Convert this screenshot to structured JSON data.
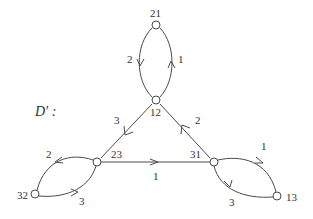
{
  "title": "D′ :",
  "nodes": [
    {
      "id": "21",
      "label": "21",
      "x": 156,
      "y": 25
    },
    {
      "id": "12",
      "label": "12",
      "x": 156,
      "y": 100
    },
    {
      "id": "23",
      "label": "23",
      "x": 97,
      "y": 162
    },
    {
      "id": "31",
      "label": "31",
      "x": 214,
      "y": 162
    },
    {
      "id": "32",
      "label": "32",
      "x": 35,
      "y": 194
    },
    {
      "id": "13",
      "label": "13",
      "x": 277,
      "y": 196
    }
  ],
  "edges": [
    {
      "from": "21",
      "to": "12",
      "label": "2"
    },
    {
      "from": "12",
      "to": "21",
      "label": "1"
    },
    {
      "from": "12",
      "to": "23",
      "label": "3"
    },
    {
      "from": "31",
      "to": "12",
      "label": "2"
    },
    {
      "from": "23",
      "to": "31",
      "label": "1"
    },
    {
      "from": "23",
      "to": "32",
      "label": "2"
    },
    {
      "from": "32",
      "to": "23",
      "label": "3"
    },
    {
      "from": "13",
      "to": "31",
      "label": "1"
    },
    {
      "from": "31",
      "to": "13",
      "label": "3"
    }
  ],
  "colors": {
    "stroke": "#4a4a4a",
    "text": "#333333",
    "background": "#ffffff"
  }
}
